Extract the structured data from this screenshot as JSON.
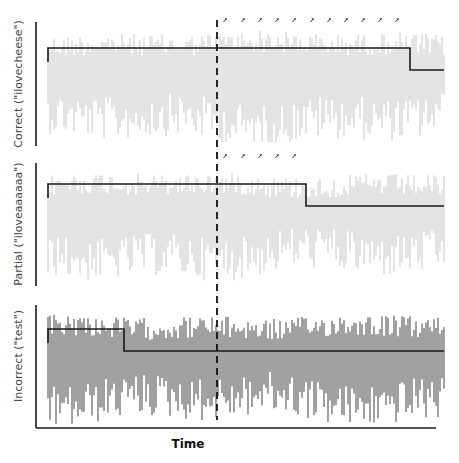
{
  "chart_data": {
    "type": "line",
    "title": "",
    "xlabel": "Time",
    "ylabel": "",
    "grid": false,
    "legend": "none",
    "event_line": {
      "style": "dashed",
      "x_px": 217,
      "description": "vertical dashed marker"
    },
    "panels": [
      {
        "name": "correct",
        "ylabel": "Correct (\"ilovecheese\")",
        "trace_color": "#c8c8c8",
        "trace_style": "light gray dense oscillation",
        "step": [
          {
            "x_start": 48,
            "x_end": 410,
            "level": "high"
          },
          {
            "x_start": 410,
            "x_end": 444,
            "level": "low"
          }
        ],
        "step_transitions": 1,
        "arrow_markers": 11,
        "arrow_x_px": [
          225,
          243,
          260,
          277,
          294,
          312,
          329,
          346,
          363,
          380,
          397
        ]
      },
      {
        "name": "partial",
        "ylabel": "Partial (\"iloveaaaaaa\")",
        "trace_color": "#c8c8c8",
        "trace_style": "light gray dense oscillation",
        "step": [
          {
            "x_start": 48,
            "x_end": 306,
            "level": "high"
          },
          {
            "x_start": 306,
            "x_end": 444,
            "level": "low"
          }
        ],
        "step_transitions": 1,
        "arrow_markers": 5,
        "arrow_x_px": [
          225,
          243,
          260,
          277,
          294
        ]
      },
      {
        "name": "incorrect",
        "ylabel": "Incorrect (\"test\")",
        "trace_color": "#6e6e6e",
        "trace_style": "dark gray dense oscillation",
        "step": [
          {
            "x_start": 48,
            "x_end": 124,
            "level": "high"
          },
          {
            "x_start": 124,
            "x_end": 444,
            "level": "low"
          }
        ],
        "step_transitions": 1,
        "arrow_markers": 0,
        "arrow_x_px": []
      }
    ]
  },
  "layout": {
    "panels_px": [
      {
        "axis_x": 36,
        "top": 22,
        "bottom": 146,
        "plot_left": 48,
        "plot_right": 444,
        "high_y": 48,
        "low_y": 70,
        "arrow_y": 20,
        "label_cy": 84
      },
      {
        "axis_x": 36,
        "top": 163,
        "bottom": 286,
        "plot_left": 48,
        "plot_right": 444,
        "high_y": 184,
        "low_y": 206,
        "arrow_y": 156,
        "label_cy": 224
      },
      {
        "axis_x": 36,
        "top": 305,
        "bottom": 428,
        "plot_left": 48,
        "plot_right": 444,
        "high_y": 329,
        "low_y": 351,
        "arrow_y": null,
        "label_cy": 356
      }
    ],
    "x_axis": {
      "y": 428,
      "x_start": 36,
      "x_end": 436,
      "label_x": 188,
      "label_y": 448
    },
    "dashed_line": {
      "x": 217,
      "y_top": 20,
      "y_bottom": 420
    },
    "step_color": "#1a1a1a",
    "axis_color": "#1a1a1a",
    "arrow_color": "#333333"
  }
}
